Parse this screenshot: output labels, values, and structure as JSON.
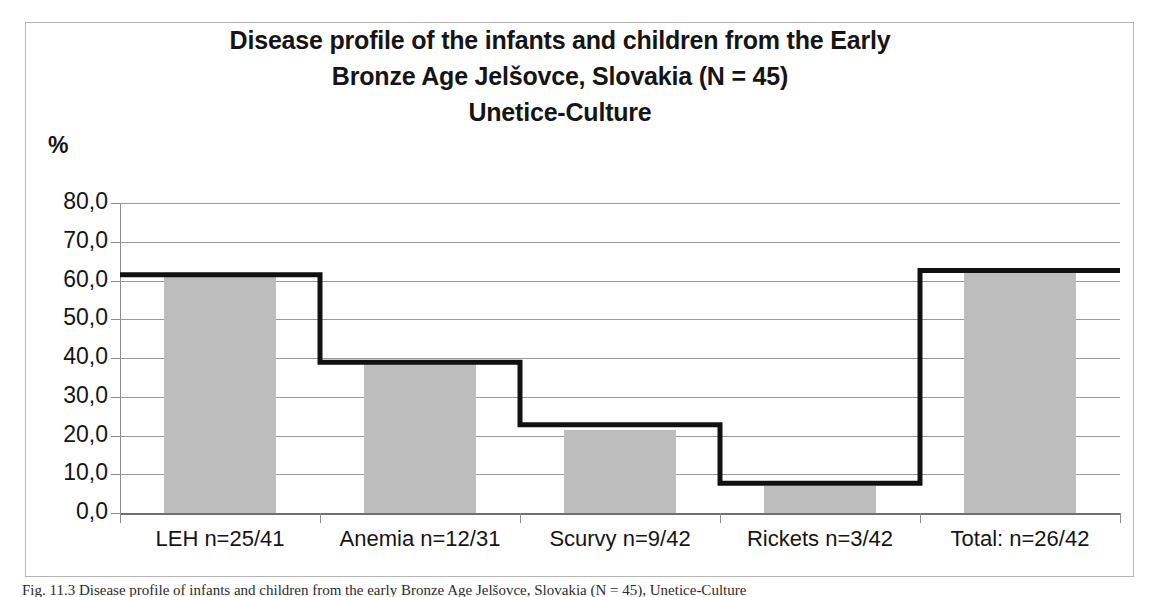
{
  "figure": {
    "unit_label": "%",
    "caption": "Fig. 11.3  Disease profile of infants and children from the early Bronze Age Jelšovce, Slovakia (N = 45), Unetice-Culture"
  },
  "chart_data": {
    "type": "bar",
    "title": "Disease profile of the infants and children from the Early Bronze Age Jelšovce, Slovakia (N = 45) Unetice-Culture",
    "title_lines": [
      "Disease profile of the infants and children from the Early",
      "Bronze Age Jelšovce, Slovakia (N = 45)",
      "Unetice-Culture"
    ],
    "xlabel": "",
    "ylabel": "%",
    "ylim": [
      0.0,
      80.0
    ],
    "ytick_labels": [
      "80,0",
      "70,0",
      "60,0",
      "50,0",
      "40,0",
      "30,0",
      "20,0",
      "10,0",
      "0,0"
    ],
    "ytick_values": [
      80.0,
      70.0,
      60.0,
      50.0,
      40.0,
      30.0,
      20.0,
      10.0,
      0.0
    ],
    "grid": true,
    "legend": false,
    "legend_position": "none",
    "categories": [
      "LEH n=25/41",
      "Anemia n=12/31",
      "Scurvy n=9/42",
      "Rickets n=3/42",
      "Total: n=26/42"
    ],
    "series": [
      {
        "name": "Prevalence (bars)",
        "render": "bar",
        "color": "#bdbdbd",
        "values": [
          61.0,
          38.7,
          21.4,
          7.1,
          61.9
        ]
      },
      {
        "name": "Prevalence (step outline)",
        "render": "step",
        "color": "#111111",
        "values": [
          61.5,
          38.9,
          22.8,
          7.7,
          62.6
        ]
      }
    ],
    "colors": {
      "bar_fill": "#bdbdbd",
      "step_line": "#111111",
      "gridline": "#9a9a9a",
      "axis": "#8c8c8c",
      "text": "#151515",
      "frame": "#b5b5b5"
    }
  }
}
